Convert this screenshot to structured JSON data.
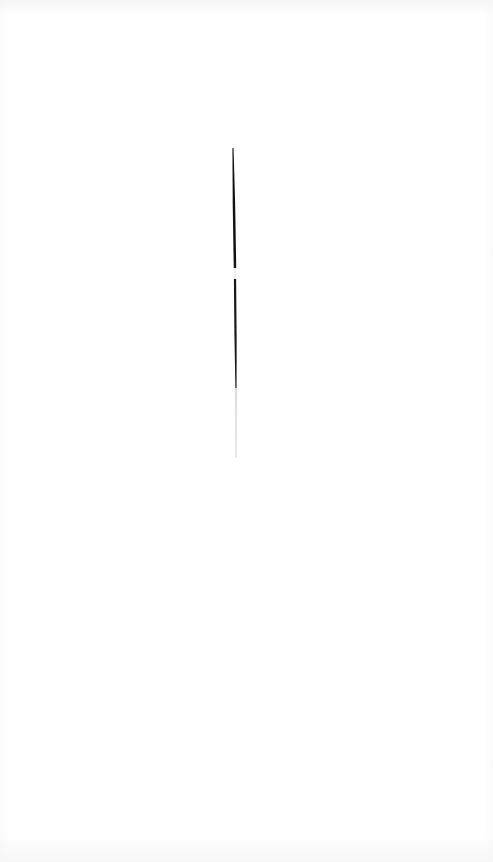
{
  "document": {
    "kind": "scanned-artwork",
    "background_color": "#ffffff",
    "page_width": 493,
    "page_height": 862,
    "visible_text": "",
    "mark_count": 1
  },
  "artwork": {
    "name": "vertical-ink-stroke",
    "description": "single hand-drawn near-vertical ink line",
    "ink_color_dark": "#111111",
    "ink_color_mid": "#3a3a3a",
    "ink_color_tail": "#b9b9bc",
    "center_x": 234,
    "top_y": 148,
    "bottom_y": 458,
    "total_height": 310,
    "segments": [
      {
        "name": "upper-dark-segment",
        "start_y": 148,
        "end_y": 268,
        "start_x": 233,
        "end_x": 235,
        "start_width": 1.1,
        "mid_width": 3.2,
        "end_width": 2.4,
        "color": "#121212",
        "opacity": 1
      },
      {
        "name": "ink-break-gap",
        "start_y": 268,
        "end_y": 279,
        "start_x": 235,
        "end_x": 235,
        "start_width": 1.4,
        "mid_width": 1.0,
        "end_width": 1.6,
        "color": "#c9c9cc",
        "opacity": 0.45
      },
      {
        "name": "middle-dark-segment",
        "start_y": 279,
        "end_y": 388,
        "start_x": 235,
        "end_x": 236,
        "start_width": 2.2,
        "mid_width": 2.7,
        "end_width": 1.2,
        "color": "#161616",
        "opacity": 1
      },
      {
        "name": "fading-tail-segment",
        "start_y": 388,
        "end_y": 458,
        "start_x": 236,
        "end_x": 236,
        "start_width": 1.1,
        "mid_width": 0.9,
        "end_width": 0.7,
        "color": "#b5b5b9",
        "opacity": 0.85
      }
    ]
  }
}
